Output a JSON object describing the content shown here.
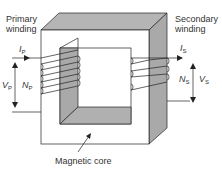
{
  "diagram": {
    "labels": {
      "primary_line1": "Primary",
      "primary_line2": "winding",
      "secondary_line1": "Secondary",
      "secondary_line2": "winding",
      "core": "Magnetic core"
    },
    "symbols": {
      "ip": "I",
      "ip_sub": "P",
      "vp": "V",
      "vp_sub": "P",
      "np": "N",
      "np_sub": "P",
      "is": "I",
      "is_sub": "S",
      "ns": "N",
      "ns_sub": "S",
      "vs": "V",
      "vs_sub": "S"
    },
    "colors": {
      "core_shade": "#a9a9a9",
      "core_top": "#b5b5b5",
      "line": "#222222",
      "face": "#ffffff"
    },
    "primary_turns": 5,
    "secondary_turns": 4
  }
}
